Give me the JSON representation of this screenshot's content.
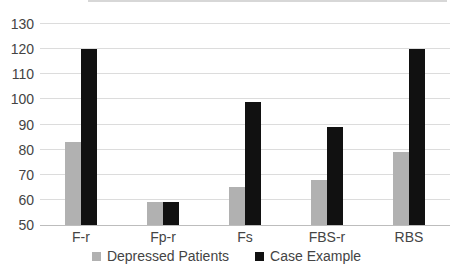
{
  "chart_data": {
    "type": "bar",
    "categories": [
      "F-r",
      "Fp-r",
      "Fs",
      "FBS-r",
      "RBS"
    ],
    "series": [
      {
        "name": "Depressed Patients",
        "color": "#b1b1b1",
        "values": [
          83,
          59,
          65,
          68,
          79
        ]
      },
      {
        "name": "Case Example",
        "color": "#111111",
        "values": [
          120,
          59,
          99,
          89,
          120
        ]
      }
    ],
    "title": "",
    "xlabel": "",
    "ylabel": "",
    "ylim": [
      50,
      130
    ],
    "yticks": [
      50,
      60,
      70,
      80,
      90,
      100,
      110,
      120,
      130
    ],
    "grid": true,
    "legend_position": "bottom"
  },
  "styles": {
    "background": "#ffffff",
    "grid_color": "#dcdcdc",
    "axis_line_color": "#bdbdbd",
    "text_color": "#444444",
    "top_artifact_color": "#d7d7d7"
  }
}
